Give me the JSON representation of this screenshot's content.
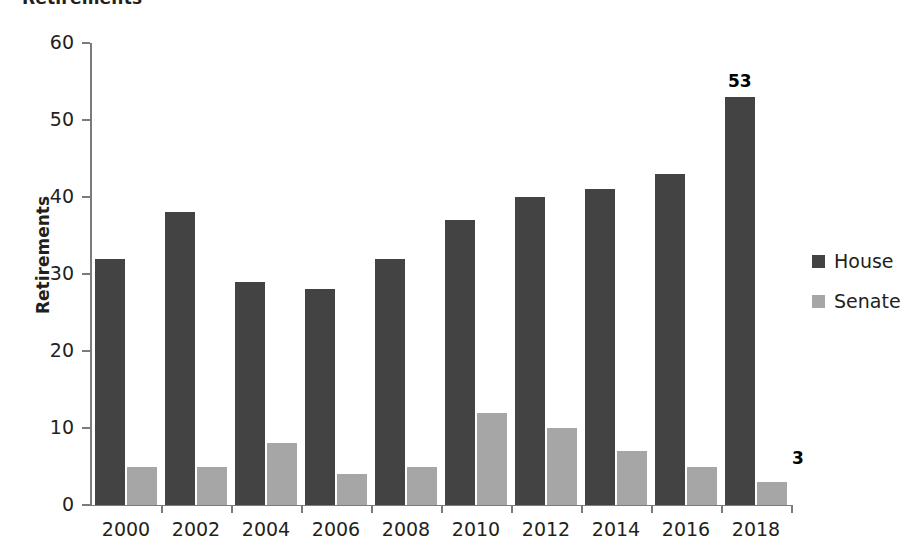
{
  "title": "Retirements",
  "legend": {
    "position": "right",
    "items": [
      {
        "label": "House",
        "color": "#434343",
        "swatch_name": "legend-swatch-house"
      },
      {
        "label": "Senate",
        "color": "#a6a6a6",
        "swatch_name": "legend-swatch-senate"
      }
    ]
  },
  "axes": {
    "y_title": "Retirements",
    "y_ticks": [
      "0",
      "10",
      "20",
      "30",
      "40",
      "50",
      "60"
    ],
    "x_ticks": [
      "2000",
      "2002",
      "2004",
      "2006",
      "2008",
      "2010",
      "2012",
      "2014",
      "2016",
      "2018"
    ]
  },
  "annotations": [
    {
      "text": "53",
      "series": "House",
      "category": "2018"
    },
    {
      "text": "3",
      "series": "Senate",
      "category": "2018"
    }
  ],
  "chart_data": {
    "type": "bar",
    "title": "Retirements",
    "xlabel": "",
    "ylabel": "Retirements",
    "ylim": [
      0,
      60
    ],
    "ytick_step": 10,
    "grid": false,
    "legend_position": "right",
    "categories": [
      "2000",
      "2002",
      "2004",
      "2006",
      "2008",
      "2010",
      "2012",
      "2014",
      "2016",
      "2018"
    ],
    "series": [
      {
        "name": "House",
        "color": "#434343",
        "values": [
          32,
          38,
          29,
          28,
          32,
          37,
          40,
          41,
          43,
          53
        ]
      },
      {
        "name": "Senate",
        "color": "#a6a6a6",
        "values": [
          5,
          5,
          8,
          4,
          5,
          12,
          10,
          7,
          5,
          3
        ]
      }
    ],
    "data_labels": {
      "2018": {
        "House": 53,
        "Senate": 3
      }
    }
  }
}
